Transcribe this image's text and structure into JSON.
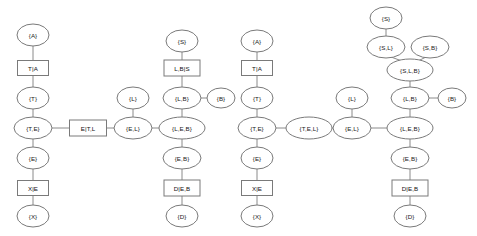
{
  "figure": {
    "type": "diagram",
    "subtype": "junction-tree",
    "background_color": "#ffffff",
    "edge_color": "#8a8a8a",
    "node_stroke_color": "#7a7a7a",
    "node_fill_color": "#ffffff",
    "text_color": "#1a1a1a",
    "width": 477,
    "height": 236
  },
  "nodes": [
    {
      "id": "L1_A",
      "label": "{A}",
      "shape": "ellipse",
      "cx": 33,
      "cy": 35,
      "rx": 16,
      "ry": 11
    },
    {
      "id": "L1_TA",
      "label": "T|A",
      "shape": "rectangle",
      "cx": 33,
      "cy": 68,
      "w": 31,
      "h": 15
    },
    {
      "id": "L1_T",
      "label": "{T}",
      "shape": "ellipse",
      "cx": 33,
      "cy": 98,
      "rx": 16,
      "ry": 11
    },
    {
      "id": "L1_TE",
      "label": "{T,E}",
      "shape": "ellipse",
      "cx": 33,
      "cy": 128,
      "rx": 19,
      "ry": 11
    },
    {
      "id": "L1_E",
      "label": "{E}",
      "shape": "ellipse",
      "cx": 33,
      "cy": 158,
      "rx": 16,
      "ry": 11
    },
    {
      "id": "L1_XE",
      "label": "X|E",
      "shape": "rectangle",
      "cx": 33,
      "cy": 188,
      "w": 31,
      "h": 15
    },
    {
      "id": "L1_X",
      "label": "{X}",
      "shape": "ellipse",
      "cx": 33,
      "cy": 216,
      "rx": 16,
      "ry": 11
    },
    {
      "id": "L1_ETL",
      "label": "E|T,L",
      "shape": "rectangle",
      "cx": 88,
      "cy": 128,
      "w": 37,
      "h": 16
    },
    {
      "id": "L1_L",
      "label": "{L}",
      "shape": "ellipse",
      "cx": 133,
      "cy": 98,
      "rx": 16,
      "ry": 11
    },
    {
      "id": "L1_EL",
      "label": "{E,L}",
      "shape": "ellipse",
      "cx": 133,
      "cy": 128,
      "rx": 19,
      "ry": 11
    },
    {
      "id": "L1_S",
      "label": "{S}",
      "shape": "ellipse",
      "cx": 182,
      "cy": 41,
      "rx": 16,
      "ry": 11
    },
    {
      "id": "L1_LBS",
      "label": "L,B|S",
      "shape": "rectangle",
      "cx": 182,
      "cy": 68,
      "w": 36,
      "h": 16
    },
    {
      "id": "L1_LB",
      "label": "{L,B}",
      "shape": "ellipse",
      "cx": 182,
      "cy": 98,
      "rx": 19,
      "ry": 11
    },
    {
      "id": "L1_B",
      "label": "{B}",
      "shape": "ellipse",
      "cx": 221,
      "cy": 98,
      "rx": 14,
      "ry": 10
    },
    {
      "id": "L1_LEB",
      "label": "{L,E,B}",
      "shape": "ellipse",
      "cx": 182,
      "cy": 128,
      "rx": 23,
      "ry": 11
    },
    {
      "id": "L1_EB",
      "label": "{E,B}",
      "shape": "ellipse",
      "cx": 182,
      "cy": 158,
      "rx": 19,
      "ry": 11
    },
    {
      "id": "L1_DEB",
      "label": "D|E,B",
      "shape": "rectangle",
      "cx": 182,
      "cy": 188,
      "w": 36,
      "h": 16
    },
    {
      "id": "L1_D",
      "label": "{D}",
      "shape": "ellipse",
      "cx": 182,
      "cy": 216,
      "rx": 16,
      "ry": 11
    },
    {
      "id": "R2_A",
      "label": "{A}",
      "shape": "ellipse",
      "cx": 257,
      "cy": 41,
      "rx": 16,
      "ry": 11
    },
    {
      "id": "R2_TA",
      "label": "T|A",
      "shape": "rectangle",
      "cx": 257,
      "cy": 68,
      "w": 31,
      "h": 15
    },
    {
      "id": "R2_T",
      "label": "{T}",
      "shape": "ellipse",
      "cx": 257,
      "cy": 98,
      "rx": 16,
      "ry": 11
    },
    {
      "id": "R2_TE",
      "label": "{T,E}",
      "shape": "ellipse",
      "cx": 257,
      "cy": 128,
      "rx": 19,
      "ry": 11
    },
    {
      "id": "R2_E",
      "label": "{E}",
      "shape": "ellipse",
      "cx": 257,
      "cy": 158,
      "rx": 16,
      "ry": 11
    },
    {
      "id": "R2_XE",
      "label": "X|E",
      "shape": "rectangle",
      "cx": 257,
      "cy": 188,
      "w": 31,
      "h": 15
    },
    {
      "id": "R2_X",
      "label": "{X}",
      "shape": "ellipse",
      "cx": 257,
      "cy": 216,
      "rx": 16,
      "ry": 11
    },
    {
      "id": "R2_TEL",
      "label": "{T,E,L}",
      "shape": "ellipse",
      "cx": 309,
      "cy": 128,
      "rx": 23,
      "ry": 11
    },
    {
      "id": "R2_L",
      "label": "{L}",
      "shape": "ellipse",
      "cx": 352,
      "cy": 98,
      "rx": 16,
      "ry": 11
    },
    {
      "id": "R2_EL",
      "label": "{E,L}",
      "shape": "ellipse",
      "cx": 352,
      "cy": 128,
      "rx": 19,
      "ry": 11
    },
    {
      "id": "R2_S",
      "label": "{S}",
      "shape": "ellipse",
      "cx": 386,
      "cy": 18,
      "rx": 16,
      "ry": 11
    },
    {
      "id": "R2_SL",
      "label": "{S,L}",
      "shape": "ellipse",
      "cx": 386,
      "cy": 47,
      "rx": 19,
      "ry": 11
    },
    {
      "id": "R2_SB",
      "label": "{S,B}",
      "shape": "ellipse",
      "cx": 430,
      "cy": 47,
      "rx": 19,
      "ry": 11
    },
    {
      "id": "R2_SLB",
      "label": "{S,L,B}",
      "shape": "ellipse",
      "cx": 410,
      "cy": 70,
      "rx": 23,
      "ry": 11
    },
    {
      "id": "R2_LB",
      "label": "{L,B}",
      "shape": "ellipse",
      "cx": 410,
      "cy": 98,
      "rx": 19,
      "ry": 11
    },
    {
      "id": "R2_B",
      "label": "{B}",
      "shape": "ellipse",
      "cx": 452,
      "cy": 98,
      "rx": 14,
      "ry": 10
    },
    {
      "id": "R2_LEB",
      "label": "{L,E,B}",
      "shape": "ellipse",
      "cx": 410,
      "cy": 128,
      "rx": 23,
      "ry": 11
    },
    {
      "id": "R2_EB",
      "label": "{E,B}",
      "shape": "ellipse",
      "cx": 410,
      "cy": 158,
      "rx": 19,
      "ry": 11
    },
    {
      "id": "R2_DEB",
      "label": "D|E,B",
      "shape": "rectangle",
      "cx": 410,
      "cy": 188,
      "w": 36,
      "h": 16
    },
    {
      "id": "R2_D",
      "label": "{D}",
      "shape": "ellipse",
      "cx": 410,
      "cy": 216,
      "rx": 16,
      "ry": 11
    }
  ],
  "edges": [
    {
      "from": "L1_A",
      "to": "L1_TA",
      "x1": 33,
      "y1": 46,
      "x2": 33,
      "y2": 60
    },
    {
      "from": "L1_TA",
      "to": "L1_T",
      "x1": 33,
      "y1": 76,
      "x2": 33,
      "y2": 87
    },
    {
      "from": "L1_T",
      "to": "L1_TE",
      "x1": 33,
      "y1": 109,
      "x2": 33,
      "y2": 117
    },
    {
      "from": "L1_TE",
      "to": "L1_ETL",
      "x1": 52,
      "y1": 128,
      "x2": 69,
      "y2": 128
    },
    {
      "from": "L1_ETL",
      "to": "L1_EL",
      "x1": 107,
      "y1": 128,
      "x2": 114,
      "y2": 128
    },
    {
      "from": "L1_L",
      "to": "L1_EL",
      "x1": 133,
      "y1": 109,
      "x2": 133,
      "y2": 117
    },
    {
      "from": "L1_EL",
      "to": "L1_LEB",
      "x1": 152,
      "y1": 128,
      "x2": 159,
      "y2": 128
    },
    {
      "from": "L1_TE",
      "to": "L1_E",
      "x1": 33,
      "y1": 139,
      "x2": 33,
      "y2": 147
    },
    {
      "from": "L1_E",
      "to": "L1_XE",
      "x1": 33,
      "y1": 169,
      "x2": 33,
      "y2": 180
    },
    {
      "from": "L1_XE",
      "to": "L1_X",
      "x1": 33,
      "y1": 196,
      "x2": 33,
      "y2": 205
    },
    {
      "from": "L1_S",
      "to": "L1_LBS",
      "x1": 182,
      "y1": 52,
      "x2": 182,
      "y2": 60
    },
    {
      "from": "L1_LBS",
      "to": "L1_LB",
      "x1": 182,
      "y1": 76,
      "x2": 182,
      "y2": 87
    },
    {
      "from": "L1_LB",
      "to": "L1_B",
      "x1": 201,
      "y1": 98,
      "x2": 207,
      "y2": 98
    },
    {
      "from": "L1_LB",
      "to": "L1_LEB",
      "x1": 182,
      "y1": 109,
      "x2": 182,
      "y2": 117
    },
    {
      "from": "L1_LEB",
      "to": "L1_EB",
      "x1": 182,
      "y1": 139,
      "x2": 182,
      "y2": 147
    },
    {
      "from": "L1_EB",
      "to": "L1_DEB",
      "x1": 182,
      "y1": 169,
      "x2": 182,
      "y2": 180
    },
    {
      "from": "L1_DEB",
      "to": "L1_D",
      "x1": 182,
      "y1": 196,
      "x2": 182,
      "y2": 205
    },
    {
      "from": "R2_A",
      "to": "R2_TA",
      "x1": 257,
      "y1": 52,
      "x2": 257,
      "y2": 60
    },
    {
      "from": "R2_TA",
      "to": "R2_T",
      "x1": 257,
      "y1": 76,
      "x2": 257,
      "y2": 87
    },
    {
      "from": "R2_T",
      "to": "R2_TE",
      "x1": 257,
      "y1": 109,
      "x2": 257,
      "y2": 117
    },
    {
      "from": "R2_TE",
      "to": "R2_TEL",
      "x1": 276,
      "y1": 128,
      "x2": 286,
      "y2": 128
    },
    {
      "from": "R2_TEL",
      "to": "R2_EL",
      "x1": 332,
      "y1": 128,
      "x2": 333,
      "y2": 128
    },
    {
      "from": "R2_L",
      "to": "R2_EL",
      "x1": 352,
      "y1": 109,
      "x2": 352,
      "y2": 117
    },
    {
      "from": "R2_EL",
      "to": "R2_LEB",
      "x1": 371,
      "y1": 128,
      "x2": 387,
      "y2": 128
    },
    {
      "from": "R2_TE",
      "to": "R2_E",
      "x1": 257,
      "y1": 139,
      "x2": 257,
      "y2": 147
    },
    {
      "from": "R2_E",
      "to": "R2_XE",
      "x1": 257,
      "y1": 169,
      "x2": 257,
      "y2": 180
    },
    {
      "from": "R2_XE",
      "to": "R2_X",
      "x1": 257,
      "y1": 196,
      "x2": 257,
      "y2": 205
    },
    {
      "from": "R2_S",
      "to": "R2_SL",
      "x1": 386,
      "y1": 29,
      "x2": 386,
      "y2": 36
    },
    {
      "from": "R2_SL",
      "to": "R2_SLB",
      "x1": 391,
      "y1": 57,
      "x2": 402,
      "y2": 61
    },
    {
      "from": "R2_SB",
      "to": "R2_SLB",
      "x1": 426,
      "y1": 57,
      "x2": 418,
      "y2": 61
    },
    {
      "from": "R2_SLB",
      "to": "R2_LB",
      "x1": 410,
      "y1": 81,
      "x2": 410,
      "y2": 87
    },
    {
      "from": "R2_LB",
      "to": "R2_B",
      "x1": 429,
      "y1": 98,
      "x2": 438,
      "y2": 98
    },
    {
      "from": "R2_LB",
      "to": "R2_LEB",
      "x1": 410,
      "y1": 109,
      "x2": 410,
      "y2": 117
    },
    {
      "from": "R2_LEB",
      "to": "R2_EB",
      "x1": 410,
      "y1": 139,
      "x2": 410,
      "y2": 147
    },
    {
      "from": "R2_EB",
      "to": "R2_DEB",
      "x1": 410,
      "y1": 169,
      "x2": 410,
      "y2": 180
    },
    {
      "from": "R2_DEB",
      "to": "R2_D",
      "x1": 410,
      "y1": 196,
      "x2": 410,
      "y2": 205
    }
  ]
}
